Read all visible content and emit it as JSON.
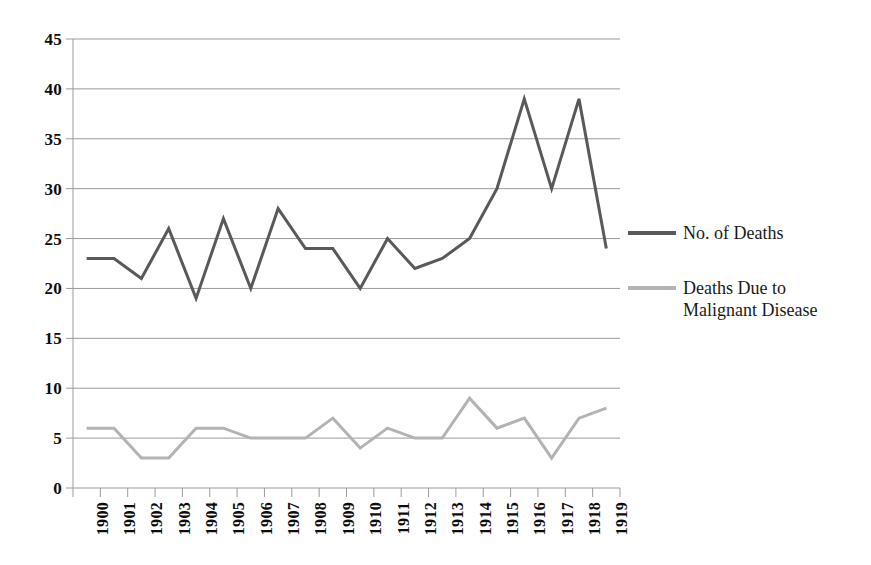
{
  "chart_data": {
    "type": "line",
    "title": "",
    "subtitle": "",
    "xlabel": "",
    "ylabel": "",
    "categories": [
      "1900",
      "1901",
      "1902",
      "1903",
      "1904",
      "1905",
      "1906",
      "1907",
      "1908",
      "1909",
      "1910",
      "1911",
      "1912",
      "1913",
      "1914",
      "1915",
      "1916",
      "1917",
      "1918",
      "1919"
    ],
    "ylim": [
      0,
      45
    ],
    "ytick_step": 5,
    "yticks": [
      "0",
      "5",
      "10",
      "15",
      "20",
      "25",
      "30",
      "35",
      "40",
      "45"
    ],
    "grid": "horizontal",
    "legend_position": "right",
    "series": [
      {
        "name": "No. of Deaths",
        "color": "#595959",
        "values": [
          23,
          23,
          21,
          26,
          19,
          27,
          20,
          28,
          24,
          24,
          20,
          25,
          22,
          23,
          25,
          30,
          39,
          30,
          39,
          24
        ]
      },
      {
        "name": "Deaths Due to Malignant Disease",
        "name_line1": "Deaths Due to",
        "name_line2": "Malignant Disease",
        "color": "#b3b3b3",
        "values": [
          6,
          6,
          3,
          3,
          6,
          6,
          5,
          5,
          5,
          7,
          4,
          6,
          5,
          5,
          9,
          6,
          7,
          3,
          7,
          8
        ]
      }
    ]
  },
  "colors": {
    "series1": "#595959",
    "series2": "#b3b3b3",
    "gridline": "#9b9b9b",
    "axis": "#9b9b9b",
    "text": "#0d0d0d"
  }
}
